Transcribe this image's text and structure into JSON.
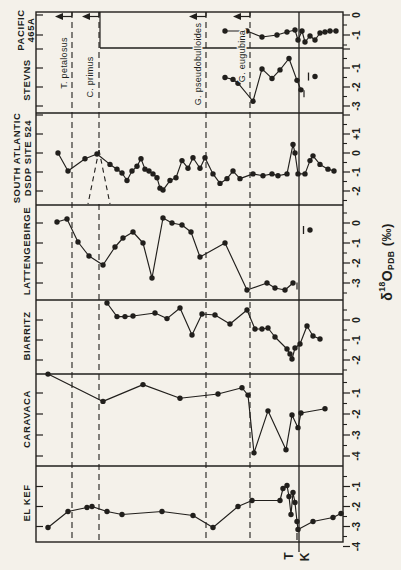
{
  "figure": {
    "bg": "#f4f1ea",
    "ink": "#211f1c",
    "axis_label": {
      "delta": "δ",
      "sup": "18",
      "o": "O",
      "sub": "PDB",
      "unit": " (‰)"
    },
    "kt_marker": {
      "tertiary": "T",
      "cretaceous": "K"
    }
  },
  "frame": {
    "x0": 36,
    "x1": 343,
    "y0": 12,
    "y1": 542,
    "kt_x": 299,
    "kt_y_ext": 552
  },
  "zones": [
    {
      "name": "T. petalosus",
      "x": 72,
      "label_cx": 65,
      "label_cy": 63
    },
    {
      "name": "C. primus",
      "x": 99,
      "label_cx": 91,
      "label_cy": 77,
      "split": {
        "y_start": 150,
        "y_end": 204,
        "x_left": 88,
        "x_right": 110
      }
    },
    {
      "name": "G. pseudobulloides",
      "x": 206,
      "label_cx": 199,
      "label_cy": 64
    },
    {
      "name": "G. eugubina",
      "x": 250,
      "label_cx": 243,
      "label_cy": 56
    }
  ],
  "chart_data": {
    "type": "line",
    "value_axis": "δ18O PDB (‰)",
    "x_axis": "stratigraphic position (pixels along section; right = Cretaceous, left = Tertiary)",
    "panels": [
      {
        "name": "PACIFIC 465A",
        "label_lines": [
          "PACIFIC",
          "465A"
        ],
        "label_x": [
          21,
          31
        ],
        "label_cy": 30,
        "band": [
          12,
          48
        ],
        "divider_x_start": 100,
        "cal": {
          "v": 0,
          "y": 15,
          "ppu": 20
        },
        "tick_labels": [
          {
            "v": 0,
            "t": "0"
          },
          {
            "v": -1,
            "t": "-1"
          }
        ],
        "points": [
          [
            225,
            -0.8
          ],
          [
            247,
            -0.8
          ],
          [
            262,
            -1.1
          ],
          [
            277,
            -1.0
          ],
          [
            287,
            -0.85
          ],
          [
            295,
            -0.75
          ],
          [
            298,
            -1.25
          ],
          [
            302,
            -0.8
          ],
          [
            305,
            -1.35
          ],
          [
            310,
            -1.05
          ],
          [
            315,
            -1.25
          ],
          [
            320,
            -0.9
          ],
          [
            325,
            -0.85
          ],
          [
            330,
            -0.8
          ],
          [
            336,
            -0.8
          ]
        ],
        "overbar_point": null,
        "extra_dash": null
      },
      {
        "name": "STEVNS",
        "label_lines": [
          "STEVNS"
        ],
        "label_x": [
          27
        ],
        "label_cy": 80,
        "band": [
          48,
          113
        ],
        "divider_x_start": 36,
        "cal": {
          "v": -1,
          "y": 68,
          "ppu": 19
        },
        "tick_labels": [
          {
            "v": -1,
            "t": "-1"
          },
          {
            "v": -2,
            "t": "-2"
          },
          {
            "v": -3,
            "t": "-3"
          }
        ],
        "points": [
          [
            225,
            -1.5
          ],
          [
            233,
            -1.6
          ],
          [
            238,
            -1.8
          ],
          [
            253,
            -2.75
          ],
          [
            262,
            -1.05
          ],
          [
            272,
            -1.55
          ],
          [
            280,
            -1.1
          ],
          [
            289,
            -0.5
          ],
          [
            297,
            -1.65
          ],
          [
            301,
            -2.15
          ]
        ],
        "overbar_point": [
          315,
          -1.45
        ],
        "extra_dash": [
          304,
          -2.35
        ]
      },
      {
        "name": "SOUTH ATLANTIC DSDP SITE 524",
        "label_lines": [
          "SOUTH ATLANTIC",
          "DSDP SITE 524"
        ],
        "label_x": [
          17,
          28
        ],
        "label_cy": 158,
        "band": [
          113,
          205
        ],
        "divider_x_start": 36,
        "cal": {
          "v": 0,
          "y": 153,
          "ppu": 19
        },
        "tick_labels": [
          {
            "v": 1,
            "t": "+1"
          },
          {
            "v": 0,
            "t": "0"
          },
          {
            "v": -1,
            "t": "-1"
          },
          {
            "v": -2,
            "t": "-2"
          }
        ],
        "points": [
          [
            58,
            0
          ],
          [
            68,
            -0.95
          ],
          [
            85,
            -0.3
          ],
          [
            97,
            -0.05
          ],
          [
            110,
            -0.6
          ],
          [
            117,
            -0.85
          ],
          [
            122,
            -1.05
          ],
          [
            127,
            -1.45
          ],
          [
            132,
            -0.95
          ],
          [
            137,
            -0.7
          ],
          [
            141,
            -0.3
          ],
          [
            145,
            -0.85
          ],
          [
            149,
            -0.95
          ],
          [
            153,
            -1.1
          ],
          [
            157,
            -1.3
          ],
          [
            160,
            -1.85
          ],
          [
            163,
            -1.95
          ],
          [
            170,
            -1.45
          ],
          [
            176,
            -1.3
          ],
          [
            182,
            -0.4
          ],
          [
            188,
            -0.8
          ],
          [
            193,
            -0.25
          ],
          [
            200,
            -0.8
          ],
          [
            205,
            -0.25
          ],
          [
            213,
            -1.1
          ],
          [
            220,
            -1.6
          ],
          [
            227,
            -1.35
          ],
          [
            233,
            -0.95
          ],
          [
            240,
            -1.35
          ],
          [
            253,
            -1.1
          ],
          [
            263,
            -1.2
          ],
          [
            272,
            -1.1
          ],
          [
            278,
            -1.2
          ],
          [
            287,
            -1.1
          ],
          [
            293,
            0.45
          ],
          [
            295,
            0
          ],
          [
            298,
            -1.1
          ],
          [
            305,
            -1.1
          ],
          [
            310,
            -0.4
          ],
          [
            313,
            -0.15
          ],
          [
            320,
            -0.6
          ],
          [
            328,
            -0.85
          ],
          [
            334,
            -0.95
          ]
        ],
        "overbar_point": null,
        "extra_dash": null
      },
      {
        "name": "LATTENGEBIRGE",
        "label_lines": [
          "LATTENGEBIRGE"
        ],
        "label_x": [
          27
        ],
        "label_cy": 251,
        "band": [
          205,
          300
        ],
        "divider_x_start": 36,
        "cal": {
          "v": 0,
          "y": 223,
          "ppu": 20
        },
        "tick_labels": [
          {
            "v": 0,
            "t": "0"
          },
          {
            "v": -1,
            "t": "-1"
          },
          {
            "v": -2,
            "t": "-2"
          },
          {
            "v": -3,
            "t": "-3"
          }
        ],
        "points": [
          [
            57,
            0.05
          ],
          [
            67,
            0.2
          ],
          [
            78,
            -0.95
          ],
          [
            89,
            -1.65
          ],
          [
            103,
            -2.1
          ],
          [
            115,
            -1.2
          ],
          [
            123,
            -0.75
          ],
          [
            133,
            -0.45
          ],
          [
            143,
            -1.0
          ],
          [
            152,
            -2.75
          ],
          [
            163,
            0.25
          ],
          [
            172,
            0
          ],
          [
            182,
            -0.1
          ],
          [
            191,
            -0.45
          ],
          [
            200,
            -1.7
          ],
          [
            225,
            -1.0
          ],
          [
            247,
            -3.35
          ],
          [
            267,
            -3.0
          ],
          [
            275,
            -3.25
          ],
          [
            285,
            -3.35
          ],
          [
            293,
            -3.0
          ]
        ],
        "overbar_point": [
          310,
          -0.35
        ],
        "extra_dash": [
          297,
          -3.15
        ]
      },
      {
        "name": "BIARRITZ",
        "label_lines": [
          "BIARRITZ"
        ],
        "label_x": [
          27
        ],
        "label_cy": 336,
        "band": [
          300,
          374
        ],
        "divider_x_start": 36,
        "cal": {
          "v": 0,
          "y": 320,
          "ppu": 20
        },
        "tick_labels": [
          {
            "v": 0,
            "t": "0"
          },
          {
            "v": -1,
            "t": "-1"
          },
          {
            "v": -2,
            "t": "-2"
          }
        ],
        "points": [
          [
            107,
            0.85
          ],
          [
            117,
            0.17
          ],
          [
            125,
            0.17
          ],
          [
            133,
            0.2
          ],
          [
            155,
            0.35
          ],
          [
            167,
            0.07
          ],
          [
            180,
            0.6
          ],
          [
            192,
            -0.75
          ],
          [
            202,
            0.3
          ],
          [
            215,
            0.25
          ],
          [
            230,
            -0.2
          ],
          [
            247,
            0.5
          ],
          [
            255,
            -0.45
          ],
          [
            262,
            -0.45
          ],
          [
            268,
            -0.4
          ],
          [
            275,
            -0.85
          ],
          [
            287,
            -1.45
          ],
          [
            290,
            -1.7
          ],
          [
            292,
            -1.95
          ],
          [
            295,
            -1.4
          ],
          [
            300,
            -1.2
          ],
          [
            307,
            -0.3
          ],
          [
            313,
            -0.8
          ],
          [
            320,
            -0.95
          ]
        ],
        "overbar_point": null,
        "extra_dash": null
      },
      {
        "name": "CARAVACA",
        "label_lines": [
          "CARAVACA"
        ],
        "label_x": [
          27
        ],
        "label_cy": 419,
        "band": [
          374,
          466
        ],
        "divider_x_start": 36,
        "cal": {
          "v": -1,
          "y": 393,
          "ppu": 21
        },
        "tick_labels": [
          {
            "v": -1,
            "t": "-1"
          },
          {
            "v": -2,
            "t": "-2"
          },
          {
            "v": -3,
            "t": "-3"
          },
          {
            "v": -4,
            "t": "-4"
          }
        ],
        "points": [
          [
            48,
            -0.1
          ],
          [
            103,
            -1.4
          ],
          [
            143,
            -0.6
          ],
          [
            180,
            -1.25
          ],
          [
            218,
            -1.05
          ],
          [
            242,
            -0.75
          ],
          [
            248,
            -1.1
          ],
          [
            254,
            -3.85
          ],
          [
            268,
            -1.85
          ],
          [
            286,
            -3.7
          ],
          [
            292,
            -2.05
          ],
          [
            298,
            -2.65
          ],
          [
            301,
            -1.95
          ],
          [
            325,
            -1.75
          ]
        ],
        "overbar_point": null,
        "extra_dash": null
      },
      {
        "name": "EL KEF",
        "label_lines": [
          "EL KEF"
        ],
        "label_x": [
          27
        ],
        "label_cy": 503,
        "band": [
          466,
          542
        ],
        "divider_x_start": 36,
        "cal": {
          "v": -1,
          "y": 486.5,
          "ppu": 20
        },
        "tick_labels": [
          {
            "v": -1,
            "t": "-1"
          },
          {
            "v": -2,
            "t": "-2"
          },
          {
            "v": -3,
            "t": "-3"
          },
          {
            "v": -4,
            "t": "-4"
          }
        ],
        "points": [
          [
            48,
            -3.05
          ],
          [
            68,
            -2.25
          ],
          [
            87,
            -2.05
          ],
          [
            92,
            -2.0
          ],
          [
            107,
            -2.25
          ],
          [
            122,
            -2.4
          ],
          [
            162,
            -2.25
          ],
          [
            193,
            -2.45
          ],
          [
            213,
            -3.05
          ],
          [
            238,
            -2.0
          ],
          [
            252,
            -1.7
          ],
          [
            280,
            -1.7
          ],
          [
            283,
            -1.1
          ],
          [
            287,
            -0.95
          ],
          [
            289,
            -1.5
          ],
          [
            291,
            -2.4
          ],
          [
            293,
            -1.3
          ],
          [
            295,
            -1.8
          ],
          [
            297,
            -2.75
          ],
          [
            298,
            -3.15
          ],
          [
            313,
            -2.75
          ],
          [
            333,
            -2.55
          ],
          [
            341,
            -2.35
          ]
        ],
        "overbar_point": null,
        "extra_dash": [
          297,
          -3.5
        ]
      }
    ]
  }
}
